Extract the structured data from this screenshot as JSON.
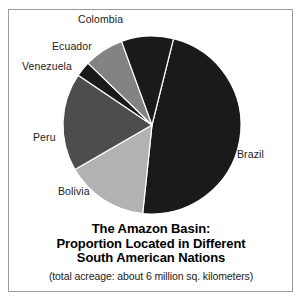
{
  "chart_data": {
    "type": "pie",
    "title": "The Amazon Basin: Proportion Located in Different South American Nations",
    "title_lines": [
      "The Amazon Basin:",
      "Proportion Located in Different",
      "South American Nations"
    ],
    "subtitle": "(total acreage: about 6 million sq. kilometers)",
    "xlabel": "",
    "ylabel": "",
    "legend_position": "none",
    "grid": false,
    "total_label": "about 6 million sq. kilometers",
    "categories": [
      "Brazil",
      "Bolivia",
      "Peru",
      "Venezuela",
      "Ecuador",
      "Colombia"
    ],
    "values": [
      48,
      15,
      18,
      3,
      7,
      9
    ],
    "units": "percent of basin area",
    "slices": [
      {
        "label": "Brazil",
        "value": 48,
        "start_angle": 14,
        "end_angle": 186,
        "color": "#1a1a1a"
      },
      {
        "label": "Bolivia",
        "value": 15,
        "start_angle": 186,
        "end_angle": 240,
        "color": "#b2b2b2"
      },
      {
        "label": "Peru",
        "value": 18,
        "start_angle": 240,
        "end_angle": 304,
        "color": "#4d4d4d"
      },
      {
        "label": "Venezuela",
        "value": 3,
        "start_angle": 304,
        "end_angle": 314,
        "color": "#1a1a1a"
      },
      {
        "label": "Ecuador",
        "value": 7,
        "start_angle": 314,
        "end_angle": 340,
        "color": "#838383"
      },
      {
        "label": "Colombia",
        "value": 9,
        "start_angle": 340,
        "end_angle": 374,
        "color": "#1a1a1a"
      }
    ],
    "colors": {
      "black": "#1a1a1a",
      "dark_gray": "#4d4d4d",
      "medium_gray": "#838383",
      "light_gray": "#b2b2b2",
      "outline": "#ffffff",
      "frame": "#9a9a9a",
      "background": "#ffffff",
      "text": "#1b1b1b"
    },
    "geometry": {
      "center_x": 152,
      "center_y": 125,
      "radius": 89
    }
  },
  "labels": {
    "colombia": "Colombia",
    "ecuador": "Ecuador",
    "venezuela": "Venezuela",
    "peru": "Peru",
    "bolivia": "Bolivia",
    "brazil": "Brazil"
  }
}
